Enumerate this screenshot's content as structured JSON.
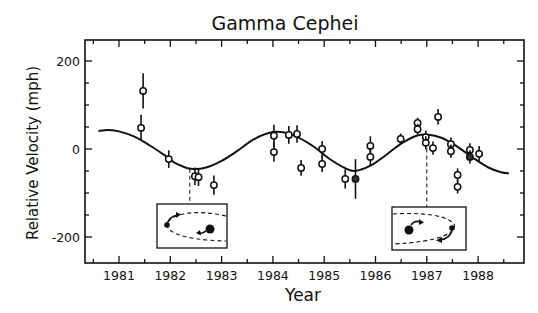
{
  "chart_data": {
    "type": "scatter",
    "title": "Gamma Cephei",
    "xlabel": "Year",
    "ylabel": "Relative Velocity (mph)",
    "xlim": [
      1980.35,
      1988.9
    ],
    "ylim": [
      -250,
      240
    ],
    "x_ticks": [
      1981,
      1982,
      1983,
      1984,
      1985,
      1986,
      1987,
      1988
    ],
    "x_tick_labels": [
      "1981",
      "1982",
      "1983",
      "1984",
      "1985",
      "1986",
      "1987",
      "1988"
    ],
    "x_minor_step": 0.5,
    "y_ticks": [
      -200,
      0,
      200
    ],
    "y_tick_labels": [
      "-200",
      "0",
      "200"
    ],
    "y_minor_step": 50,
    "grid": false,
    "legend": null,
    "series": [
      {
        "name": "Observations",
        "style": "open-circle-with-errorbar",
        "points": [
          {
            "x": 1981.47,
            "y": 132,
            "err": 40
          },
          {
            "x": 1981.43,
            "y": 48,
            "err": 30
          },
          {
            "x": 1981.97,
            "y": -23,
            "err": 20
          },
          {
            "x": 1982.48,
            "y": -62,
            "err": 20
          },
          {
            "x": 1982.55,
            "y": -64,
            "err": 20
          },
          {
            "x": 1982.85,
            "y": -82,
            "err": 22
          },
          {
            "x": 1984.02,
            "y": 30,
            "err": 25
          },
          {
            "x": 1984.02,
            "y": -7,
            "err": 22
          },
          {
            "x": 1984.31,
            "y": 32,
            "err": 20
          },
          {
            "x": 1984.47,
            "y": 34,
            "err": 20
          },
          {
            "x": 1984.55,
            "y": -43,
            "err": 18
          },
          {
            "x": 1984.96,
            "y": 0,
            "err": 18
          },
          {
            "x": 1984.96,
            "y": -34,
            "err": 18
          },
          {
            "x": 1985.41,
            "y": -68,
            "err": 22
          },
          {
            "x": 1985.61,
            "y": -68,
            "err": 45,
            "filled": true
          },
          {
            "x": 1985.9,
            "y": 7,
            "err": 22
          },
          {
            "x": 1985.9,
            "y": -18,
            "err": 20
          },
          {
            "x": 1986.49,
            "y": 23,
            "err": 12
          },
          {
            "x": 1986.82,
            "y": 59,
            "err": 12
          },
          {
            "x": 1986.82,
            "y": 45,
            "err": 12
          },
          {
            "x": 1986.98,
            "y": 27,
            "err": 15
          },
          {
            "x": 1986.98,
            "y": 14,
            "err": 15
          },
          {
            "x": 1987.12,
            "y": 2,
            "err": 15
          },
          {
            "x": 1987.22,
            "y": 73,
            "err": 18
          },
          {
            "x": 1987.47,
            "y": 11,
            "err": 15
          },
          {
            "x": 1987.47,
            "y": -5,
            "err": 15
          },
          {
            "x": 1987.6,
            "y": -59,
            "err": 15
          },
          {
            "x": 1987.6,
            "y": -86,
            "err": 15
          },
          {
            "x": 1987.84,
            "y": -2,
            "err": 15
          },
          {
            "x": 1987.84,
            "y": -18,
            "err": 15,
            "filled": true
          },
          {
            "x": 1988.02,
            "y": -11,
            "err": 18
          }
        ]
      },
      {
        "name": "Orbit fit",
        "style": "line",
        "points": [
          {
            "x": 1980.6,
            "y": 41
          },
          {
            "x": 1980.8,
            "y": 43
          },
          {
            "x": 1981.0,
            "y": 40
          },
          {
            "x": 1981.3,
            "y": 28
          },
          {
            "x": 1981.6,
            "y": 8
          },
          {
            "x": 1981.9,
            "y": -15
          },
          {
            "x": 1982.1,
            "y": -32
          },
          {
            "x": 1982.4,
            "y": -45
          },
          {
            "x": 1982.7,
            "y": -42
          },
          {
            "x": 1983.0,
            "y": -27
          },
          {
            "x": 1983.3,
            "y": -5
          },
          {
            "x": 1983.6,
            "y": 20
          },
          {
            "x": 1983.9,
            "y": 36
          },
          {
            "x": 1984.2,
            "y": 38
          },
          {
            "x": 1984.5,
            "y": 26
          },
          {
            "x": 1984.8,
            "y": 5
          },
          {
            "x": 1985.1,
            "y": -22
          },
          {
            "x": 1985.4,
            "y": -43
          },
          {
            "x": 1985.6,
            "y": -50
          },
          {
            "x": 1985.9,
            "y": -38
          },
          {
            "x": 1986.2,
            "y": -14
          },
          {
            "x": 1986.5,
            "y": 12
          },
          {
            "x": 1986.8,
            "y": 30
          },
          {
            "x": 1987.0,
            "y": 33
          },
          {
            "x": 1987.3,
            "y": 25
          },
          {
            "x": 1987.6,
            "y": 5
          },
          {
            "x": 1987.9,
            "y": -20
          },
          {
            "x": 1988.2,
            "y": -42
          },
          {
            "x": 1988.45,
            "y": -53
          },
          {
            "x": 1988.6,
            "y": -55
          }
        ]
      }
    ],
    "annotations": [
      {
        "type": "dashed-line",
        "x": 1982.38,
        "from_y": -45,
        "to_y": -125,
        "target": "inset-1"
      },
      {
        "type": "dashed-line",
        "x": 1987.0,
        "from_y": 33,
        "to_y": -135,
        "target": "inset-2"
      },
      {
        "type": "inset",
        "id": "inset-1",
        "description": "orbit diagram: planet at far side moving up, star on right",
        "x_range": [
          1981.73,
          1983.1
        ],
        "y_range": [
          -125,
          -225
        ]
      },
      {
        "type": "inset",
        "id": "inset-2",
        "description": "orbit diagram: star on left, planet at right end moving down",
        "x_range": [
          1986.3,
          1987.73
        ],
        "y_range": [
          -132,
          -230
        ]
      }
    ]
  }
}
